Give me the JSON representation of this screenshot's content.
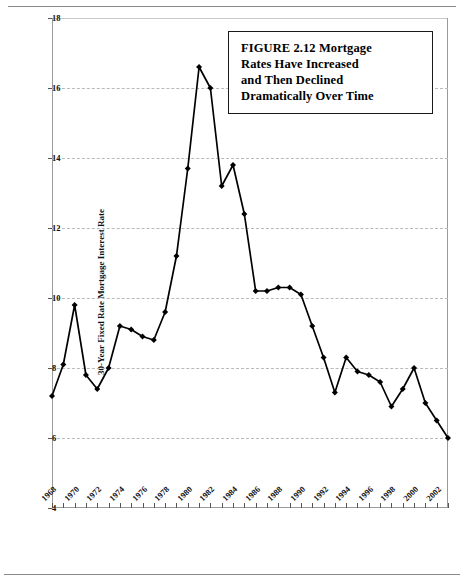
{
  "figure": {
    "title_lines": [
      "FIGURE 2.12  Mortgage",
      "Rates Have Increased",
      "and Then Declined",
      "Dramatically Over Time"
    ]
  },
  "chart_data": {
    "type": "line",
    "title": "FIGURE 2.12  Mortgage Rates Have Increased and Then Declined Dramatically Over Time",
    "xlabel": "",
    "ylabel": "30-Year Fixed Rate Mortgage Interest Rate",
    "xlim": [
      1968,
      2003
    ],
    "ylim": [
      4,
      18
    ],
    "yticks": [
      4,
      6,
      8,
      10,
      12,
      14,
      16,
      18
    ],
    "ytick_labels": [
      "4",
      "6",
      "8",
      "10",
      "12",
      "14",
      "16",
      "18"
    ],
    "xticks": [
      1968,
      1970,
      1972,
      1974,
      1976,
      1978,
      1980,
      1982,
      1984,
      1986,
      1988,
      1990,
      1992,
      1994,
      1996,
      1998,
      2000,
      2002
    ],
    "xtick_labels": [
      "1968",
      "1970",
      "1972",
      "1974",
      "1976",
      "1978",
      "1980",
      "1982",
      "1984",
      "1986",
      "1988",
      "1990",
      "1992",
      "1994",
      "1996",
      "1998",
      "2000",
      "2002"
    ],
    "grid": true,
    "grid_axis": "y",
    "legend": false,
    "marker": "diamond",
    "line_color": "#000000",
    "marker_color": "#000000",
    "x": [
      1968,
      1969,
      1970,
      1971,
      1972,
      1973,
      1974,
      1975,
      1976,
      1977,
      1978,
      1979,
      1980,
      1981,
      1982,
      1983,
      1984,
      1985,
      1986,
      1987,
      1988,
      1989,
      1990,
      1991,
      1992,
      1993,
      1994,
      1995,
      1996,
      1997,
      1998,
      1999,
      2000,
      2001,
      2002,
      2003
    ],
    "values": [
      7.2,
      8.1,
      9.8,
      7.8,
      7.4,
      8.0,
      9.2,
      9.1,
      8.9,
      8.8,
      9.6,
      11.2,
      13.7,
      16.6,
      16.0,
      13.2,
      13.8,
      12.4,
      10.2,
      10.2,
      10.3,
      10.3,
      10.1,
      9.2,
      8.3,
      7.3,
      8.3,
      7.9,
      7.8,
      7.6,
      6.9,
      7.4,
      8.0,
      7.0,
      6.5,
      6.0
    ],
    "series_name": "30-Year Fixed Rate Mortgage Interest Rate"
  }
}
